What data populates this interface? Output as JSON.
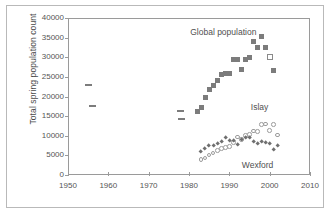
{
  "chart_data": {
    "type": "scatter",
    "title": "",
    "xlabel": "",
    "ylabel": "Total spring population count",
    "xlim": [
      1950,
      2010
    ],
    "ylim": [
      0,
      40000
    ],
    "xticks": [
      1950,
      1960,
      1970,
      1980,
      1990,
      2000,
      2010
    ],
    "yticks": [
      0,
      5000,
      10000,
      15000,
      20000,
      25000,
      30000,
      35000,
      40000
    ],
    "xtick_labels": [
      "1950",
      "1960",
      "1970",
      "1980",
      "1990",
      "2000",
      "2010"
    ],
    "ytick_labels": [
      "0",
      "5000",
      "10000",
      "15000",
      "20000",
      "25000",
      "30000",
      "35000",
      "40000"
    ],
    "grid": false,
    "legend_position": "in-plot-annotations",
    "series": [
      {
        "name": "Global population",
        "marker": "square-filled",
        "color": "#7c7c7c",
        "points": [
          [
            1982,
            16100
          ],
          [
            1983,
            17300
          ],
          [
            1984,
            19800
          ],
          [
            1985,
            21900
          ],
          [
            1986,
            22900
          ],
          [
            1987,
            24000
          ],
          [
            1988,
            25700
          ],
          [
            1989,
            25800
          ],
          [
            1990,
            25800
          ],
          [
            1991,
            29400
          ],
          [
            1992,
            29500
          ],
          [
            1993,
            27000
          ],
          [
            1994,
            29400
          ],
          [
            1995,
            30000
          ],
          [
            1996,
            34100
          ],
          [
            1997,
            32600
          ],
          [
            1998,
            35200
          ],
          [
            1999,
            32600
          ],
          [
            2001,
            26700
          ]
        ]
      },
      {
        "name": "Global population (early dashes)",
        "marker": "dash",
        "color": "#7c7c7c",
        "points": [
          [
            1955,
            23000
          ],
          [
            1956,
            17500
          ],
          [
            1978,
            16400
          ],
          [
            1978.2,
            14300
          ]
        ]
      },
      {
        "name": "Global population (open square)",
        "marker": "square-open",
        "color": "#8a8a8a",
        "points": [
          [
            2000,
            30000
          ]
        ]
      },
      {
        "name": "Islay",
        "marker": "circle-open",
        "color": "#9b9b9b",
        "points": [
          [
            1983,
            4000
          ],
          [
            1984,
            4300
          ],
          [
            1985,
            5100
          ],
          [
            1986,
            5600
          ],
          [
            1987,
            6200
          ],
          [
            1988,
            6700
          ],
          [
            1989,
            7000
          ],
          [
            1990,
            7200
          ],
          [
            1991,
            8300
          ],
          [
            1992,
            9700
          ],
          [
            1993,
            9000
          ],
          [
            1994,
            10100
          ],
          [
            1995,
            10300
          ],
          [
            1996,
            11200
          ],
          [
            1997,
            11100
          ],
          [
            1998,
            12800
          ],
          [
            1999,
            13000
          ],
          [
            2000,
            11400
          ],
          [
            2001,
            12900
          ],
          [
            2002,
            10200
          ]
        ]
      },
      {
        "name": "Wexford",
        "marker": "diamond-filled",
        "color": "#6f6f6f",
        "points": [
          [
            1983,
            6000
          ],
          [
            1984,
            6700
          ],
          [
            1985,
            7400
          ],
          [
            1986,
            7400
          ],
          [
            1987,
            7900
          ],
          [
            1988,
            8500
          ],
          [
            1989,
            9400
          ],
          [
            1990,
            8700
          ],
          [
            1991,
            8800
          ],
          [
            1992,
            7800
          ],
          [
            1993,
            9100
          ],
          [
            1994,
            9400
          ],
          [
            1995,
            9400
          ],
          [
            1996,
            8600
          ],
          [
            1997,
            8000
          ],
          [
            1998,
            8600
          ],
          [
            1999,
            8300
          ],
          [
            2000,
            7900
          ],
          [
            2001,
            6400
          ],
          [
            2002,
            7400
          ]
        ]
      }
    ],
    "annotations": [
      {
        "text": "Global population",
        "x": 1988.5,
        "y": 36200
      },
      {
        "text": "Islay",
        "x": 1997.5,
        "y": 17100
      },
      {
        "text": "Wexford",
        "x": 1997.0,
        "y": 2400
      }
    ]
  }
}
